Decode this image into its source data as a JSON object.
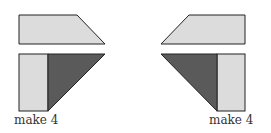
{
  "colors": {
    "light": "#dcdcdc",
    "dark": "#5a5a5a",
    "stroke": "#222222"
  },
  "left_unit": {
    "label": "make 4"
  },
  "right_unit": {
    "label": "make 4"
  }
}
